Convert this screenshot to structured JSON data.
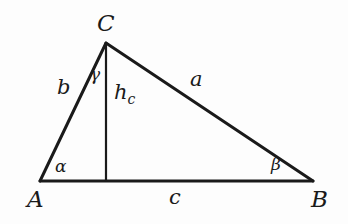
{
  "figure": {
    "type": "geometry-diagram",
    "background_color": "#fdfdfd",
    "stroke_color": "#1a1a1a",
    "side_stroke_width": 3,
    "altitude_stroke_width": 2.2
  },
  "geometry": {
    "vertices": {
      "A": {
        "x": 40,
        "y": 181
      },
      "B": {
        "x": 313,
        "y": 181
      },
      "C": {
        "x": 106,
        "y": 43
      },
      "H": {
        "x": 106,
        "y": 181
      }
    },
    "edges": [
      {
        "name": "side-c",
        "from": "A",
        "to": "B"
      },
      {
        "name": "side-b",
        "from": "A",
        "to": "C"
      },
      {
        "name": "side-a",
        "from": "C",
        "to": "B"
      },
      {
        "name": "altitude-hc",
        "from": "C",
        "to": "H"
      }
    ]
  },
  "labels": {
    "vertex_a": {
      "text": "A",
      "x": 27,
      "y": 188
    },
    "vertex_b": {
      "text": "B",
      "x": 311,
      "y": 188
    },
    "vertex_c": {
      "text": "C",
      "x": 97,
      "y": 12
    },
    "side_a": {
      "text": "a",
      "x": 190,
      "y": 69
    },
    "side_b": {
      "text": "b",
      "x": 57,
      "y": 77
    },
    "side_c": {
      "text": "c",
      "x": 169,
      "y": 187
    },
    "altitude": {
      "base": "h",
      "sub": "c",
      "x": 114,
      "y": 82
    },
    "angle_alpha": {
      "text": "α",
      "x": 55,
      "y": 158
    },
    "angle_beta": {
      "text": "β",
      "x": 271,
      "y": 156
    },
    "angle_gamma": {
      "text": "γ",
      "x": 90,
      "y": 66
    }
  }
}
